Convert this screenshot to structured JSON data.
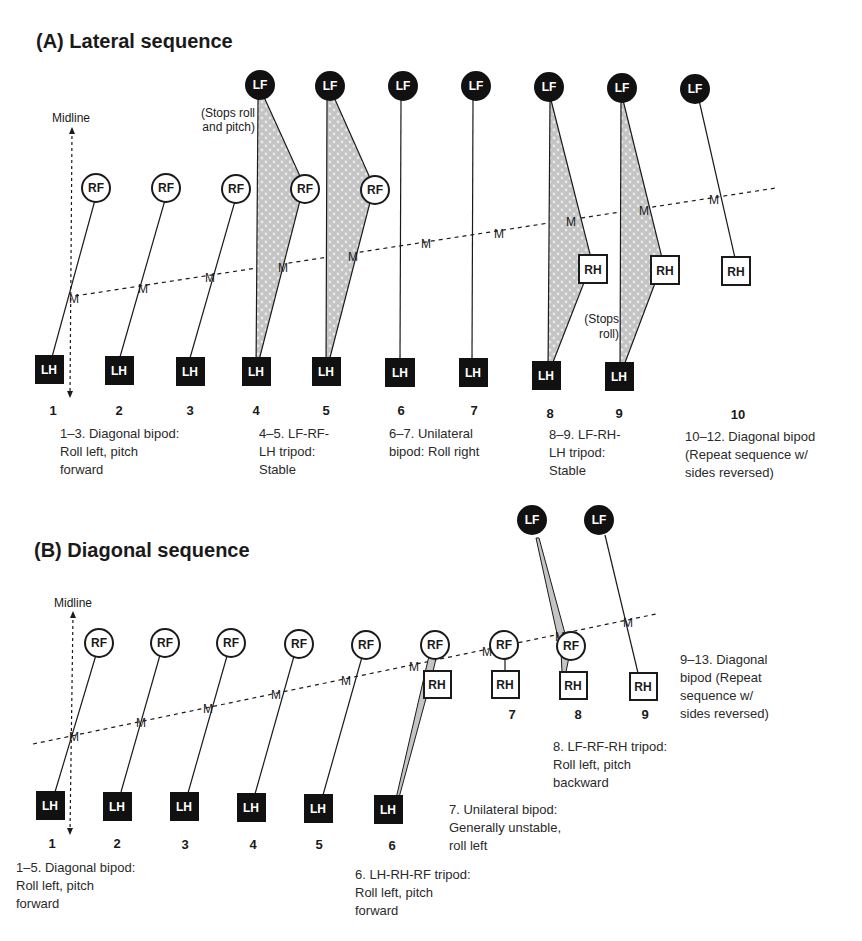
{
  "panel_a": {
    "title": "(A)  Lateral sequence",
    "midline_label": "Midline",
    "annotation_top": [
      "(Stops roll",
      "and pitch)"
    ],
    "annotation_mid": [
      "(Stops",
      "roll)"
    ],
    "step_numbers": [
      "1",
      "2",
      "3",
      "4",
      "5",
      "6",
      "7",
      "8",
      "9",
      "10"
    ],
    "foot_labels": {
      "lf": "LF",
      "rf": "RF",
      "lh": "LH",
      "rh": "RH",
      "m": "M"
    },
    "steps": [
      {
        "n": "1",
        "feet": [
          "RF",
          "LH"
        ],
        "support": "diagonal bipod"
      },
      {
        "n": "2",
        "feet": [
          "RF",
          "LH"
        ],
        "support": "diagonal bipod"
      },
      {
        "n": "3",
        "feet": [
          "RF",
          "LH"
        ],
        "support": "diagonal bipod"
      },
      {
        "n": "4",
        "feet": [
          "LF",
          "RF",
          "LH"
        ],
        "support": "tripod"
      },
      {
        "n": "5",
        "feet": [
          "LF",
          "RF",
          "LH"
        ],
        "support": "tripod"
      },
      {
        "n": "6",
        "feet": [
          "LF",
          "LH"
        ],
        "support": "unilateral bipod"
      },
      {
        "n": "7",
        "feet": [
          "LF",
          "LH"
        ],
        "support": "unilateral bipod"
      },
      {
        "n": "8",
        "feet": [
          "LF",
          "RH",
          "LH"
        ],
        "support": "tripod"
      },
      {
        "n": "9",
        "feet": [
          "LF",
          "RH",
          "LH"
        ],
        "support": "tripod"
      },
      {
        "n": "10",
        "feet": [
          "LF",
          "RH"
        ],
        "support": "diagonal bipod"
      }
    ],
    "captions": [
      [
        "1–3. Diagonal bipod:",
        "Roll left, pitch",
        "forward"
      ],
      [
        "4–5. LF-RF-",
        "LH tripod:",
        "Stable"
      ],
      [
        "6–7. Unilateral",
        "bipod: Roll right"
      ],
      [
        "8–9. LF-RH-",
        "LH tripod:",
        "Stable"
      ],
      [
        "10–12. Diagonal bipod",
        "(Repeat sequence w/",
        "sides reversed)"
      ]
    ]
  },
  "panel_b": {
    "title": "(B) Diagonal sequence",
    "midline_label": "Midline",
    "step_numbers": [
      "1",
      "2",
      "3",
      "4",
      "5",
      "6",
      "7",
      "8",
      "9"
    ],
    "steps": [
      {
        "n": "1",
        "feet": [
          "RF",
          "LH"
        ],
        "support": "diagonal bipod"
      },
      {
        "n": "2",
        "feet": [
          "RF",
          "LH"
        ],
        "support": "diagonal bipod"
      },
      {
        "n": "3",
        "feet": [
          "RF",
          "LH"
        ],
        "support": "diagonal bipod"
      },
      {
        "n": "4",
        "feet": [
          "RF",
          "LH"
        ],
        "support": "diagonal bipod"
      },
      {
        "n": "5",
        "feet": [
          "RF",
          "LH"
        ],
        "support": "diagonal bipod"
      },
      {
        "n": "6",
        "feet": [
          "RF",
          "RH",
          "LH"
        ],
        "support": "tripod"
      },
      {
        "n": "7",
        "feet": [
          "RF",
          "RH"
        ],
        "support": "unilateral bipod"
      },
      {
        "n": "8",
        "feet": [
          "LF",
          "RF",
          "RH"
        ],
        "support": "tripod"
      },
      {
        "n": "9",
        "feet": [
          "LF",
          "RH"
        ],
        "support": "diagonal bipod"
      }
    ],
    "captions": [
      [
        "1–5. Diagonal bipod:",
        "Roll left, pitch",
        "forward"
      ],
      [
        "6. LH-RH-RF tripod:",
        "Roll left, pitch",
        "forward"
      ],
      [
        "7. Unilateral bipod:",
        "Generally unstable,",
        "roll left"
      ],
      [
        "8. LF-RF-RH tripod:",
        "Roll left, pitch",
        "backward"
      ],
      [
        "9–13. Diagonal",
        "bipod (Repeat",
        "sequence w/",
        "sides reversed)"
      ]
    ]
  },
  "colors": {
    "ink": "#1a1a1a",
    "fill_stipple": "#c8c8c8",
    "background": "#ffffff"
  }
}
